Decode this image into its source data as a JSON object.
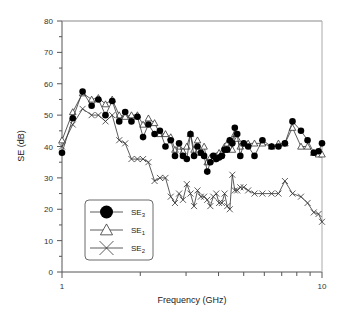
{
  "chart_data": {
    "type": "line",
    "title": "",
    "xlabel": "Frequency (GHz)",
    "ylabel": "SE (dB)",
    "xscale": "log",
    "xlim": [
      1,
      10
    ],
    "ylim": [
      0,
      80
    ],
    "xticks": [
      1,
      10
    ],
    "xtick_labels": [
      "1",
      "10"
    ],
    "yticks": [
      0,
      10,
      20,
      30,
      40,
      50,
      60,
      70,
      80
    ],
    "ytick_labels": [
      "0",
      "10",
      "20",
      "30",
      "40",
      "50",
      "60",
      "70",
      "80"
    ],
    "grid": false,
    "legend_position": "lower left",
    "series": [
      {
        "name": "SE3",
        "label_main": "SE",
        "label_sub": "3",
        "marker": "filled-circle",
        "x": [
          1.0,
          1.1,
          1.2,
          1.3,
          1.38,
          1.47,
          1.56,
          1.66,
          1.75,
          1.85,
          1.95,
          2.05,
          2.15,
          2.27,
          2.38,
          2.5,
          2.62,
          2.72,
          2.82,
          2.92,
          3.02,
          3.12,
          3.22,
          3.32,
          3.42,
          3.52,
          3.62,
          3.72,
          3.82,
          3.92,
          4.02,
          4.12,
          4.22,
          4.32,
          4.42,
          4.52,
          4.62,
          4.72,
          4.85,
          5.0,
          5.2,
          5.5,
          5.9,
          6.4,
          6.8,
          7.2,
          7.7,
          8.3,
          8.8,
          9.3,
          9.7,
          10.0
        ],
        "values": [
          38,
          49,
          57.5,
          53,
          55,
          50,
          54.5,
          48,
          51,
          48,
          49.5,
          43,
          47,
          44,
          45,
          40,
          42,
          37,
          41,
          37,
          36,
          44,
          37,
          40,
          38,
          37,
          32,
          35,
          37,
          36,
          36.5,
          37,
          39,
          39,
          42,
          41,
          46,
          44,
          37,
          41,
          40,
          37,
          42,
          40,
          40,
          41,
          48,
          45,
          42,
          38,
          38.5,
          41
        ]
      },
      {
        "name": "SE1",
        "label_main": "SE",
        "label_sub": "1",
        "marker": "open-triangle",
        "x": [
          1.0,
          1.1,
          1.2,
          1.3,
          1.38,
          1.47,
          1.56,
          1.66,
          1.75,
          1.85,
          1.95,
          2.05,
          2.15,
          2.27,
          2.38,
          2.5,
          2.62,
          2.72,
          2.82,
          2.92,
          3.02,
          3.12,
          3.22,
          3.32,
          3.42,
          3.52,
          3.62,
          3.72,
          3.82,
          3.92,
          4.02,
          4.12,
          4.22,
          4.32,
          4.42,
          4.52,
          4.62,
          4.72,
          4.85,
          5.0,
          5.2,
          5.5,
          5.9,
          6.4,
          6.8,
          7.2,
          7.7,
          8.3,
          8.8,
          9.3,
          9.7,
          10.0
        ],
        "values": [
          42,
          51,
          57,
          55,
          55.5,
          53.5,
          55,
          50,
          49.5,
          50,
          50,
          47,
          49,
          47.5,
          44,
          44,
          43,
          39,
          40,
          38.5,
          40,
          44,
          39,
          42,
          38,
          40,
          35,
          36.5,
          36,
          37,
          38,
          38,
          40,
          41,
          42,
          39,
          44,
          42.5,
          40,
          41,
          41,
          41,
          41,
          40,
          41,
          41,
          46,
          40,
          40,
          38,
          37.5,
          37.5
        ]
      },
      {
        "name": "SE2",
        "label_main": "SE",
        "label_sub": "2",
        "marker": "x-cross",
        "x": [
          1.0,
          1.1,
          1.2,
          1.3,
          1.38,
          1.47,
          1.56,
          1.66,
          1.75,
          1.85,
          1.95,
          2.05,
          2.15,
          2.27,
          2.38,
          2.5,
          2.62,
          2.72,
          2.82,
          2.92,
          3.02,
          3.12,
          3.22,
          3.32,
          3.42,
          3.52,
          3.62,
          3.72,
          3.82,
          3.92,
          4.02,
          4.12,
          4.22,
          4.32,
          4.42,
          4.52,
          4.62,
          4.72,
          4.85,
          5.0,
          5.2,
          5.5,
          5.9,
          6.4,
          6.8,
          7.2,
          7.7,
          8.3,
          8.8,
          9.3,
          9.7,
          10.0
        ],
        "values": [
          40,
          47,
          52,
          50,
          50,
          48,
          50,
          42,
          41,
          36,
          36,
          36,
          35,
          29,
          30,
          30,
          24,
          22,
          25,
          23,
          28,
          25,
          21,
          26,
          24,
          24,
          23,
          21,
          24,
          25,
          22,
          22,
          25,
          21,
          20,
          31,
          26,
          26,
          27,
          27,
          26,
          25,
          25,
          25,
          25,
          29,
          25,
          24,
          22,
          19,
          18.5,
          16
        ]
      }
    ]
  },
  "axes": {
    "xlabel": "Frequency (GHz)",
    "ylabel": "SE (dB)"
  },
  "legend": {
    "items": [
      {
        "main": "SE",
        "sub": "3",
        "marker": "filled-circle"
      },
      {
        "main": "SE",
        "sub": "1",
        "marker": "open-triangle"
      },
      {
        "main": "SE",
        "sub": "2",
        "marker": "x-cross"
      }
    ]
  },
  "style": {
    "axis_color": "#555555",
    "line_color": "#333333",
    "marker_fill": "#000000",
    "background": "#ffffff"
  }
}
